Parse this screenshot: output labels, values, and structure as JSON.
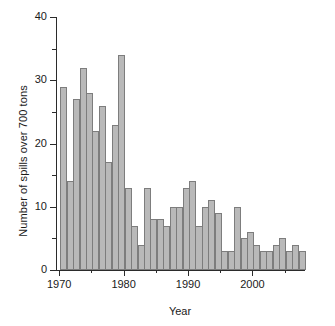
{
  "chart_data": {
    "type": "bar",
    "title": "",
    "xlabel": "Year",
    "ylabel": "Number of spills over 700 tons",
    "xlim": [
      1969.5,
      2008.0
    ],
    "ylim": [
      0,
      40
    ],
    "grid": false,
    "legend": null,
    "ytick_labels": [
      "0",
      "10",
      "20",
      "30",
      "40"
    ],
    "ytick_values": [
      0,
      10,
      20,
      30,
      40
    ],
    "yminor_values": [
      5,
      15,
      25,
      35
    ],
    "xtick_labels": [
      "1970",
      "1980",
      "1990",
      "2000"
    ],
    "xtick_values": [
      1970,
      1980,
      1990,
      2000
    ],
    "xminor_values": [
      1975,
      1985,
      1995,
      2005
    ],
    "bar_color": "#b9b9b9",
    "bar_edge_color": "#7d7d7d",
    "axis_color": "#2b2b2b",
    "categories": [
      "1970",
      "1971",
      "1972",
      "1973",
      "1974",
      "1975",
      "1976",
      "1977",
      "1978",
      "1979",
      "1980",
      "1981",
      "1982",
      "1983",
      "1984",
      "1985",
      "1986",
      "1987",
      "1988",
      "1989",
      "1990",
      "1991",
      "1992",
      "1993",
      "1994",
      "1995",
      "1996",
      "1997",
      "1998",
      "1999",
      "2000",
      "2001",
      "2002",
      "2003",
      "2004",
      "2005",
      "2006",
      "2007"
    ],
    "values": [
      29,
      14,
      27,
      32,
      28,
      22,
      26,
      17,
      23,
      34,
      13,
      7,
      4,
      13,
      8,
      8,
      7,
      10,
      10,
      13,
      14,
      7,
      10,
      11,
      9,
      3,
      3,
      10,
      5,
      6,
      4,
      3,
      3,
      4,
      5,
      3,
      4,
      3
    ]
  }
}
